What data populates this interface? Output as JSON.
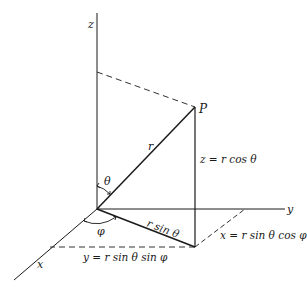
{
  "diagram": {
    "colors": {
      "line": "#1a1a1a",
      "background": "#ffffff"
    },
    "axes": {
      "x": "x",
      "y": "y",
      "z": "z"
    },
    "point": "P",
    "labels": {
      "r": "r",
      "theta": "θ",
      "phi": "φ",
      "r_sin_theta": "r sin θ",
      "z_eq": "z = r cos θ",
      "x_eq": "x = r sin θ cos φ",
      "y_eq": "y = r sin θ sin φ"
    }
  }
}
